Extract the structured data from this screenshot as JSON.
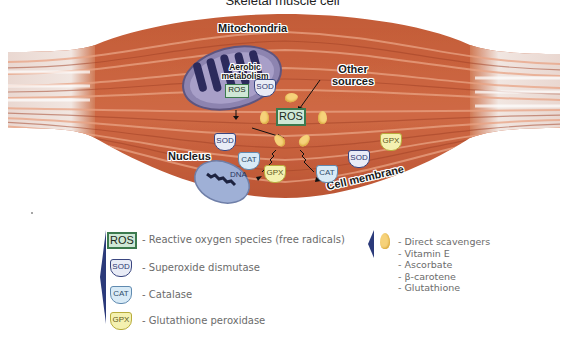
{
  "diagram": {
    "title": "Skeletal muscle cell",
    "labels": {
      "mitochondria": "Mitochondria",
      "aerobic_metabolism": "Aerobic metabolism",
      "other_sources": "Other sources",
      "nucleus": "Nucleus",
      "dna": "DNA",
      "cell_membrane": "Cell membrane"
    },
    "badges": {
      "ros": "ROS",
      "sod": "SOD",
      "cat": "CAT",
      "gpx": "GPX"
    },
    "colors": {
      "muscle": "#c8603a",
      "muscle_dark": "#a8452a",
      "tendon": "#efe4df",
      "mitochondria": "#8d84b0",
      "mitochondria_cristae": "#2c2a5c",
      "nucleus": "#9fb0d6",
      "ros_fill": "#cfe8d6",
      "ros_border": "#3c7a4e",
      "sod_border": "#3a4680",
      "cat_border": "#5f8ab0",
      "gpx_fill": "#f4f1b0",
      "scavenger": "#f6d27a",
      "legend_bar": "#2b3a7a"
    }
  },
  "legend": {
    "items": [
      {
        "badge": "ROS",
        "text": "- Reactive oxygen species (free radicals)"
      },
      {
        "badge": "SOD",
        "text": "- Superoxide dismutase"
      },
      {
        "badge": "CAT",
        "text": "- Catalase"
      },
      {
        "badge": "GPX",
        "text": "- Glutathione peroxidase"
      }
    ],
    "scavengers": {
      "items": [
        "- Direct scavengers",
        "- Vitamin E",
        "- Ascorbate",
        "- β-carotene",
        "- Glutathione"
      ]
    }
  }
}
